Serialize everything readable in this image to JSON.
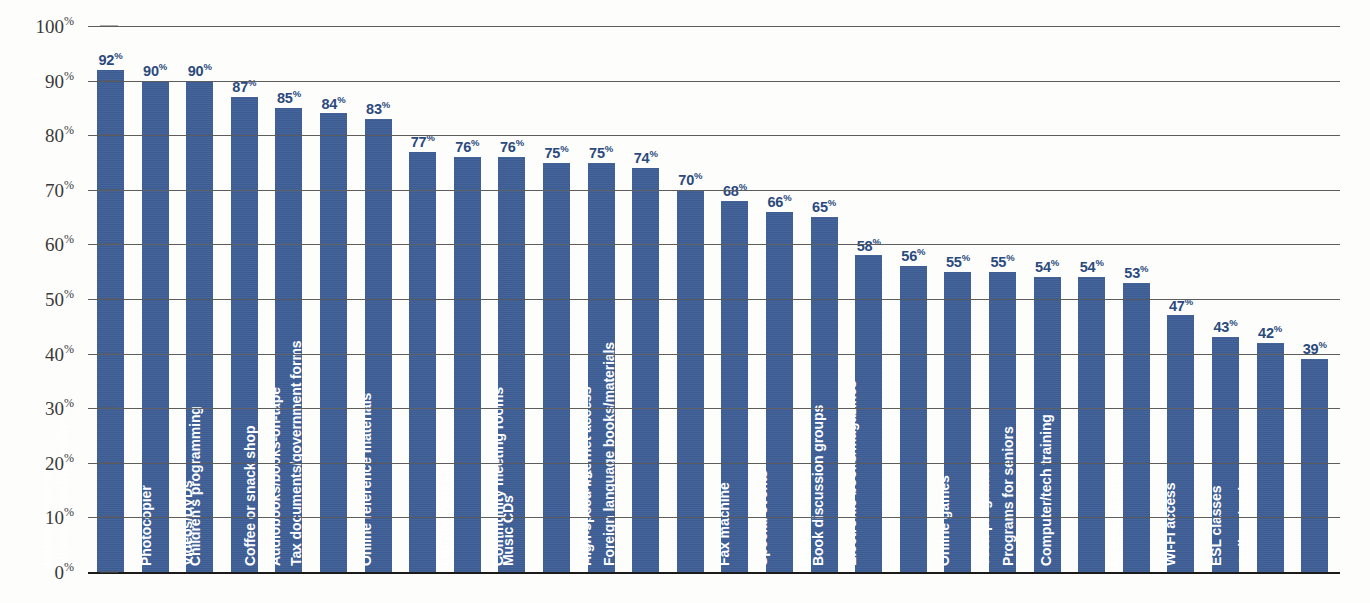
{
  "chart_data": {
    "type": "bar",
    "title": "",
    "subtitle": "",
    "xlabel": "",
    "ylabel": "",
    "ylim": [
      0,
      100
    ],
    "grid": true,
    "legend": null,
    "value_suffix": "%",
    "bar_color": "#3d5e96",
    "value_label_color": "#2b4a7d",
    "category_label_color": "#ffffff",
    "gridline_color": "#5d5d5d",
    "axis_ticks": [
      {
        "label": "0",
        "suffix": "%",
        "value": 0
      },
      {
        "label": "10",
        "suffix": "%",
        "value": 10
      },
      {
        "label": "20",
        "suffix": "%",
        "value": 20
      },
      {
        "label": "30",
        "suffix": "%",
        "value": 30
      },
      {
        "label": "40",
        "suffix": "%",
        "value": 40
      },
      {
        "label": "50",
        "suffix": "%",
        "value": 50
      },
      {
        "label": "60",
        "suffix": "%",
        "value": 60
      },
      {
        "label": "70",
        "suffix": "%",
        "value": 70
      },
      {
        "label": "80",
        "suffix": "%",
        "value": 80
      },
      {
        "label": "90",
        "suffix": "%",
        "value": 90
      },
      {
        "label": "100",
        "suffix": "%",
        "value": 100
      }
    ],
    "categories": [
      "Internet access",
      "Newspapers/magazines",
      "Photocopier",
      "Videos/DVDs",
      "Children's programming",
      "Coffee or snack shop",
      "Audiobooks/books-on-tape",
      "Tax documents/government forms",
      "Online reference materials",
      "Library Web site",
      "Music CDs",
      "Community meeting rooms",
      "Online catalog",
      "High-speed Internet access",
      "Foreign language books/materials",
      "Fax machine",
      "Special events",
      "Movie showings",
      "Book discussion groups",
      "Electronic books/magazines",
      "Online games",
      "Teen programs",
      "Programs for seniors",
      "Computer/tech training",
      "Literacy training",
      "Wi-Fi access",
      "ESL classes",
      "Online databases"
    ],
    "values": [
      92,
      90,
      90,
      87,
      85,
      84,
      83,
      77,
      76,
      76,
      75,
      75,
      74,
      70,
      68,
      66,
      65,
      58,
      56,
      55,
      55,
      54,
      54,
      53,
      47,
      43,
      42,
      39
    ]
  }
}
